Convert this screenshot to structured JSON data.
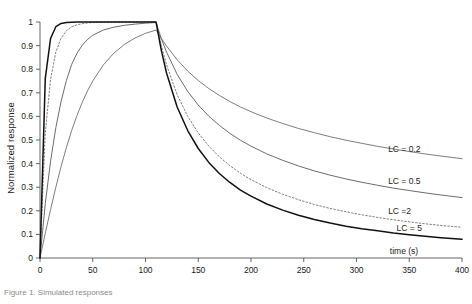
{
  "figure": {
    "caption": "Figure 1. Simulated responses"
  },
  "chart_data": {
    "type": "line",
    "title": "",
    "xlabel": "time (s)",
    "ylabel": "Normalized response",
    "xlim": [
      0,
      400
    ],
    "ylim": [
      0,
      1
    ],
    "grid": false,
    "legend_position": "inline-right",
    "xticks": [
      0,
      50,
      100,
      150,
      200,
      250,
      300,
      350,
      400
    ],
    "xticklabels": [
      "0",
      "50",
      "100",
      "150",
      "200",
      "250",
      "300",
      "350",
      "400"
    ],
    "yticks": [
      0,
      0.1,
      0.2,
      0.3,
      0.4,
      0.5,
      0.6,
      0.7,
      0.8,
      0.9,
      1
    ],
    "yticklabels": [
      "0",
      "0.1",
      "0.2",
      "0.3",
      "0.4",
      "0.5",
      "0.6",
      "0.7",
      "0.8",
      "0.9",
      "1"
    ],
    "pulse_end_s": 110,
    "x": [
      0,
      5,
      10,
      15,
      20,
      25,
      30,
      35,
      40,
      45,
      50,
      60,
      70,
      80,
      90,
      100,
      110,
      115,
      120,
      130,
      140,
      150,
      160,
      170,
      180,
      190,
      200,
      215,
      230,
      245,
      260,
      275,
      290,
      305,
      320,
      335,
      350,
      365,
      380,
      400
    ],
    "series": [
      {
        "name": "LC = 0.2",
        "label": "LC = 0.2",
        "linestyle": "solid",
        "color": "#6e6e6e",
        "linewidth": 0.9,
        "label_x": 330,
        "label_y": 0.45,
        "values": [
          0,
          0.105,
          0.205,
          0.3,
          0.388,
          0.468,
          0.54,
          0.603,
          0.659,
          0.708,
          0.75,
          0.818,
          0.868,
          0.905,
          0.932,
          0.952,
          0.966,
          0.93,
          0.898,
          0.84,
          0.792,
          0.752,
          0.718,
          0.689,
          0.663,
          0.64,
          0.62,
          0.593,
          0.57,
          0.549,
          0.531,
          0.514,
          0.499,
          0.486,
          0.473,
          0.462,
          0.451,
          0.441,
          0.432,
          0.421
        ]
      },
      {
        "name": "LC = 0.5",
        "label": "LC = 0.5",
        "linestyle": "solid",
        "color": "#5a5a5a",
        "linewidth": 0.9,
        "label_x": 330,
        "label_y": 0.315,
        "values": [
          0,
          0.23,
          0.41,
          0.552,
          0.664,
          0.752,
          0.82,
          0.867,
          0.901,
          0.926,
          0.944,
          0.966,
          0.978,
          0.986,
          0.991,
          0.995,
          0.998,
          0.93,
          0.872,
          0.778,
          0.706,
          0.648,
          0.601,
          0.562,
          0.528,
          0.499,
          0.474,
          0.441,
          0.414,
          0.39,
          0.369,
          0.351,
          0.335,
          0.321,
          0.308,
          0.296,
          0.286,
          0.276,
          0.267,
          0.256
        ]
      },
      {
        "name": "LC =2",
        "label": "LC =2",
        "linestyle": "dotted",
        "color": "#707070",
        "linewidth": 0.9,
        "label_x": 330,
        "label_y": 0.185,
        "values": [
          0,
          0.53,
          0.757,
          0.873,
          0.932,
          0.963,
          0.98,
          0.988,
          0.993,
          0.996,
          0.998,
          0.999,
          1.0,
          1.0,
          1.0,
          1.0,
          1.0,
          0.9,
          0.818,
          0.692,
          0.6,
          0.53,
          0.474,
          0.429,
          0.391,
          0.359,
          0.332,
          0.298,
          0.27,
          0.247,
          0.227,
          0.21,
          0.196,
          0.183,
          0.172,
          0.162,
          0.153,
          0.145,
          0.138,
          0.13
        ]
      },
      {
        "name": "LC = 5",
        "label": "LC = 5",
        "linestyle": "solid",
        "color": "#111111",
        "linewidth": 1.5,
        "label_x": 338,
        "label_y": 0.115,
        "values": [
          0,
          0.76,
          0.93,
          0.98,
          0.994,
          0.998,
          0.999,
          1.0,
          1.0,
          1.0,
          1.0,
          1.0,
          1.0,
          1.0,
          1.0,
          1.0,
          1.0,
          0.88,
          0.783,
          0.64,
          0.54,
          0.464,
          0.405,
          0.358,
          0.32,
          0.288,
          0.262,
          0.229,
          0.203,
          0.181,
          0.163,
          0.148,
          0.135,
          0.124,
          0.115,
          0.106,
          0.099,
          0.092,
          0.086,
          0.079
        ]
      }
    ]
  }
}
